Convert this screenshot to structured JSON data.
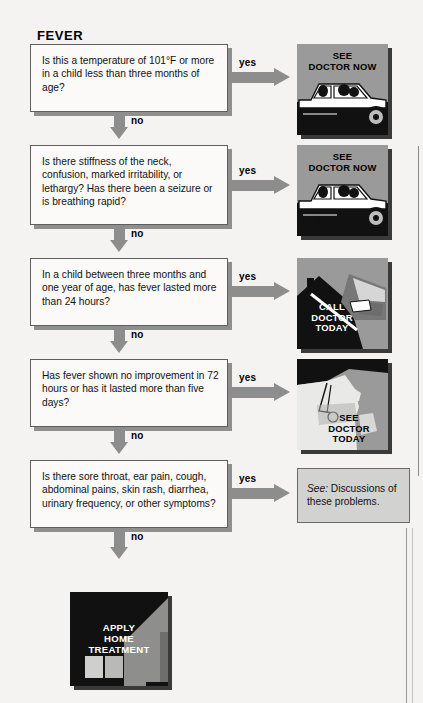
{
  "page": {
    "title": "FEVER",
    "background_color": "#f4f3f1",
    "width": 423,
    "height": 703
  },
  "labels": {
    "yes": "yes",
    "no": "no"
  },
  "steps": [
    {
      "id": "q1",
      "question": "Is this a temperature of 101°F or more in a child less than three months of age?",
      "yes_label": "yes",
      "no_label": "no",
      "action": {
        "type": "panel",
        "caption": "SEE\nDOCTOR NOW",
        "art": "car-icon",
        "background_color": "#9a9a9a"
      }
    },
    {
      "id": "q2",
      "question": "Is there stiffness of the neck, confusion, marked irritability, or lethargy? Has there been a seizure or is breathing rapid?",
      "yes_label": "yes",
      "no_label": "no",
      "action": {
        "type": "panel",
        "caption": "SEE\nDOCTOR NOW",
        "art": "car-icon",
        "background_color": "#9a9a9a"
      }
    },
    {
      "id": "q3",
      "question": "In a child between three months and one year of age, has fever lasted more than 24 hours?",
      "yes_label": "yes",
      "no_label": "no",
      "action": {
        "type": "panel",
        "caption": "CALL\nDOCTOR\nTODAY",
        "art": "hand-telephone-icon",
        "background_color": "#9a9a9a"
      }
    },
    {
      "id": "q4",
      "question": "Has fever shown no improvement in 72 hours or has it lasted more than five days?",
      "yes_label": "yes",
      "no_label": "no",
      "action": {
        "type": "panel",
        "caption": "SEE\nDOCTOR\nTODAY",
        "art": "doctor-profile-icon",
        "background_color": "#9a9a9a"
      }
    },
    {
      "id": "q5",
      "question": "Is there sore throat, ear pain, cough, abdominal pains, skin rash, diarrhea, urinary frequency, or other symptoms?",
      "yes_label": "yes",
      "no_label": "no",
      "action": {
        "type": "text-box",
        "lead": "See:",
        "text": " Discussions of these problems.",
        "background_color": "#d2d2d0"
      }
    }
  ],
  "outcome": {
    "caption": "APPLY\nHOME\nTREATMENT",
    "art": "house-icon",
    "background_color": "#000000"
  }
}
